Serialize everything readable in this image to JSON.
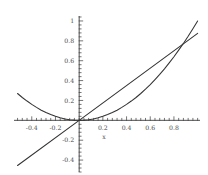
{
  "chart_data": {
    "type": "line",
    "title": "",
    "xlabel": "x",
    "ylabel": "",
    "xlim": [
      -0.55,
      1.02
    ],
    "ylim": [
      -0.52,
      1.05
    ],
    "grid": false,
    "legend": "none",
    "axis_style": "crossed-at-origin-with-minor-ticks",
    "xticks": [
      -0.4,
      -0.2,
      0.2,
      0.4,
      0.6,
      0.8
    ],
    "xtick_labels": [
      "-0.4",
      "-0.2",
      "0.2",
      "0.4",
      "0.6",
      "0.8"
    ],
    "yticks": [
      -0.4,
      -0.2,
      0.2,
      0.4,
      0.6,
      0.8,
      1
    ],
    "ytick_labels": [
      "-0.4",
      "-0.2",
      "0.2",
      "0.4",
      "0.6",
      "0.8",
      "1"
    ],
    "minor_tick_step": 0.04,
    "series": [
      {
        "name": "parabola",
        "color": "#333333",
        "points": [
          [
            -0.52,
            0.27
          ],
          [
            -0.48,
            0.23
          ],
          [
            -0.44,
            0.194
          ],
          [
            -0.4,
            0.16
          ],
          [
            -0.36,
            0.13
          ],
          [
            -0.32,
            0.102
          ],
          [
            -0.28,
            0.078
          ],
          [
            -0.24,
            0.058
          ],
          [
            -0.2,
            0.04
          ],
          [
            -0.16,
            0.026
          ],
          [
            -0.12,
            0.014
          ],
          [
            -0.08,
            0.006
          ],
          [
            -0.04,
            0.002
          ],
          [
            0.0,
            0.0
          ],
          [
            0.04,
            0.002
          ],
          [
            0.08,
            0.006
          ],
          [
            0.12,
            0.014
          ],
          [
            0.16,
            0.026
          ],
          [
            0.2,
            0.04
          ],
          [
            0.24,
            0.058
          ],
          [
            0.28,
            0.078
          ],
          [
            0.32,
            0.102
          ],
          [
            0.36,
            0.13
          ],
          [
            0.4,
            0.16
          ],
          [
            0.44,
            0.194
          ],
          [
            0.48,
            0.23
          ],
          [
            0.52,
            0.27
          ],
          [
            0.56,
            0.314
          ],
          [
            0.6,
            0.36
          ],
          [
            0.64,
            0.41
          ],
          [
            0.68,
            0.462
          ],
          [
            0.72,
            0.518
          ],
          [
            0.76,
            0.578
          ],
          [
            0.8,
            0.64
          ],
          [
            0.84,
            0.706
          ],
          [
            0.88,
            0.774
          ],
          [
            0.92,
            0.846
          ],
          [
            0.96,
            0.922
          ],
          [
            1.0,
            1.0
          ]
        ]
      },
      {
        "name": "line",
        "color": "#333333",
        "points": [
          [
            -0.52,
            -0.455
          ],
          [
            0.0,
            0.0
          ],
          [
            1.0,
            0.875
          ]
        ]
      }
    ],
    "intersections": [
      [
        0.0,
        0.0
      ],
      [
        0.86,
        0.75
      ]
    ]
  },
  "figure": {
    "background_color": "#ffffff",
    "axis_color": "#3c3c3c",
    "tick_color": "#3c3c3c",
    "label_color": "#4a4a4a",
    "curve_color": "#333333"
  }
}
